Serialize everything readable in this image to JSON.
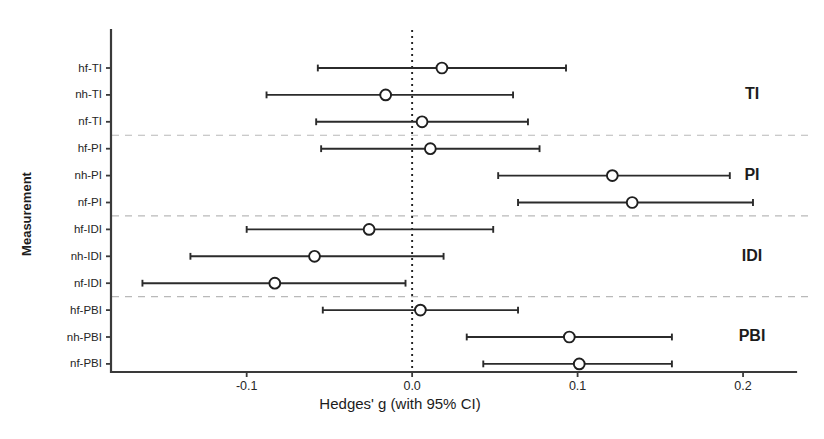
{
  "chart_data": {
    "type": "scatter",
    "subtype": "forest-plot",
    "title": "",
    "xlabel": "Hedges' g (with 95% CI)",
    "ylabel": "Measurement",
    "xlim": [
      -0.182,
      0.232
    ],
    "xticks": [
      -0.1,
      0.0,
      0.1,
      0.2
    ],
    "xtick_labels": [
      "-0.1",
      "0.0",
      "0.1",
      "0.2"
    ],
    "grid": false,
    "legend": "none",
    "reference_line": 0.0,
    "reference_line_style": "dotted",
    "effect_measure": "Hedges' g",
    "ci_level": "95%",
    "marker_style": "open-circle",
    "categories": [
      "hf-TI",
      "nh-TI",
      "nf-TI",
      "hf-PI",
      "nh-PI",
      "nf-PI",
      "hf-IDI",
      "nh-IDI",
      "nf-IDI",
      "hf-PBI",
      "nh-PBI",
      "nf-PBI"
    ],
    "rows": [
      {
        "label": "hf-TI",
        "group": "TI",
        "g": 0.018,
        "ci_low": -0.057,
        "ci_high": 0.093
      },
      {
        "label": "nh-TI",
        "group": "TI",
        "g": -0.016,
        "ci_low": -0.088,
        "ci_high": 0.061
      },
      {
        "label": "nf-TI",
        "group": "TI",
        "g": 0.006,
        "ci_low": -0.058,
        "ci_high": 0.07
      },
      {
        "label": "hf-PI",
        "group": "PI",
        "g": 0.011,
        "ci_low": -0.055,
        "ci_high": 0.077
      },
      {
        "label": "nh-PI",
        "group": "PI",
        "g": 0.121,
        "ci_low": 0.052,
        "ci_high": 0.192
      },
      {
        "label": "nf-PI",
        "group": "PI",
        "g": 0.133,
        "ci_low": 0.064,
        "ci_high": 0.206
      },
      {
        "label": "hf-IDI",
        "group": "IDI",
        "g": -0.026,
        "ci_low": -0.1,
        "ci_high": 0.049
      },
      {
        "label": "nh-IDI",
        "group": "IDI",
        "g": -0.059,
        "ci_low": -0.134,
        "ci_high": 0.019
      },
      {
        "label": "nf-IDI",
        "group": "IDI",
        "g": -0.083,
        "ci_low": -0.163,
        "ci_high": -0.004
      },
      {
        "label": "hf-PBI",
        "group": "PBI",
        "g": 0.005,
        "ci_low": -0.054,
        "ci_high": 0.064
      },
      {
        "label": "nh-PBI",
        "group": "PBI",
        "g": 0.095,
        "ci_low": 0.033,
        "ci_high": 0.157
      },
      {
        "label": "nf-PBI",
        "group": "PBI",
        "g": 0.101,
        "ci_low": 0.043,
        "ci_high": 0.157
      }
    ],
    "group_labels": [
      {
        "name": "TI",
        "rows": [
          "hf-TI",
          "nh-TI",
          "nf-TI"
        ]
      },
      {
        "name": "PI",
        "rows": [
          "hf-PI",
          "nh-PI",
          "nf-PI"
        ]
      },
      {
        "name": "IDI",
        "rows": [
          "hf-IDI",
          "nh-IDI",
          "nf-IDI"
        ]
      },
      {
        "name": "PBI",
        "rows": [
          "hf-PBI",
          "nh-PBI",
          "nf-PBI"
        ]
      }
    ],
    "separators_after_rows": [
      2,
      5,
      8
    ],
    "colors": {
      "axis": "#3a3a3a",
      "ci": "#2b2b2b",
      "marker_fill": "#ffffff",
      "marker_edge": "#1f1f1f",
      "separator": "#b9b9b9",
      "reference": "#222222",
      "text": "#1c1c1c",
      "background": "#ffffff"
    }
  }
}
